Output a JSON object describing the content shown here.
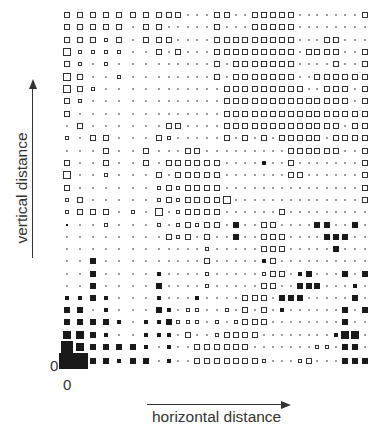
{
  "chart_data": {
    "type": "heatmap",
    "title": "",
    "xlabel": "horizontal distance",
    "ylabel": "vertical distance",
    "x_origin_label": "0",
    "y_origin_label": "0",
    "encoding": "Each cell is a square whose side length encodes magnitude; positive values drawn as open (outline) squares, negative values drawn as filled black squares; near-zero values shown as tiny dots.",
    "grid": {
      "columns": 30,
      "rows": 29
    },
    "column_x": [
      67,
      80,
      93,
      106,
      119,
      133,
      146,
      159,
      169,
      178,
      188,
      197,
      207,
      217,
      227,
      236,
      245,
      255,
      264,
      273,
      282,
      291,
      300,
      309,
      317,
      327,
      336,
      345,
      355,
      365
    ],
    "row_y_top_to_bottom": [
      15,
      27,
      40,
      52,
      64,
      77,
      89,
      101,
      114,
      126,
      138,
      151,
      163,
      175,
      188,
      200,
      212,
      225,
      237,
      249,
      261,
      274,
      286,
      298,
      310,
      322,
      335,
      347,
      361
    ],
    "values_top_to_bottom": [
      [
        5,
        5,
        5,
        5,
        5,
        5,
        5,
        5,
        5,
        5,
        0,
        0,
        0,
        5,
        5,
        0,
        0,
        5,
        4,
        4,
        4,
        4,
        0,
        0,
        0,
        0,
        0,
        0,
        0,
        4
      ],
      [
        5,
        5,
        5,
        5,
        5,
        0,
        4,
        4,
        0,
        0,
        0,
        0,
        0,
        4,
        0,
        0,
        0,
        5,
        4,
        4,
        4,
        4,
        0,
        0,
        0,
        0,
        0,
        0,
        0,
        0
      ],
      [
        5,
        5,
        5,
        3,
        5,
        0,
        4,
        5,
        5,
        0,
        0,
        0,
        0,
        4,
        4,
        4,
        4,
        4,
        4,
        4,
        4,
        4,
        0,
        0,
        0,
        4,
        4,
        0,
        0,
        0
      ],
      [
        6,
        3,
        3,
        3,
        3,
        0,
        0,
        5,
        0,
        4,
        0,
        0,
        0,
        4,
        4,
        4,
        4,
        4,
        4,
        4,
        4,
        4,
        0,
        4,
        4,
        4,
        4,
        0,
        0,
        4
      ],
      [
        5,
        3,
        0,
        3,
        0,
        0,
        0,
        0,
        0,
        0,
        0,
        0,
        0,
        4,
        0,
        4,
        4,
        4,
        4,
        4,
        4,
        4,
        0,
        0,
        0,
        0,
        4,
        0,
        0,
        4
      ],
      [
        6,
        5,
        0,
        0,
        3,
        0,
        0,
        0,
        0,
        0,
        0,
        0,
        0,
        4,
        0,
        4,
        4,
        4,
        4,
        4,
        4,
        4,
        0,
        0,
        4,
        4,
        4,
        4,
        4,
        4
      ],
      [
        6,
        5,
        3,
        0,
        0,
        0,
        0,
        0,
        0,
        0,
        0,
        0,
        0,
        0,
        5,
        5,
        5,
        5,
        5,
        5,
        5,
        5,
        5,
        0,
        0,
        4,
        4,
        4,
        0,
        4
      ],
      [
        5,
        3,
        0,
        0,
        0,
        0,
        0,
        0,
        0,
        0,
        0,
        0,
        0,
        0,
        5,
        5,
        5,
        5,
        5,
        5,
        5,
        5,
        5,
        5,
        5,
        5,
        5,
        5,
        0,
        4
      ],
      [
        5,
        0,
        0,
        0,
        0,
        0,
        0,
        0,
        0,
        0,
        0,
        0,
        0,
        0,
        5,
        5,
        5,
        5,
        5,
        5,
        5,
        5,
        5,
        5,
        5,
        5,
        5,
        5,
        5,
        5
      ],
      [
        0,
        4,
        0,
        0,
        0,
        0,
        0,
        0,
        5,
        5,
        0,
        0,
        0,
        0,
        5,
        5,
        5,
        5,
        5,
        5,
        5,
        5,
        5,
        5,
        5,
        5,
        5,
        0,
        5,
        5
      ],
      [
        3,
        0,
        5,
        4,
        0,
        0,
        0,
        5,
        3,
        0,
        0,
        0,
        0,
        0,
        5,
        0,
        5,
        0,
        5,
        0,
        5,
        5,
        5,
        5,
        5,
        0,
        5,
        5,
        5,
        5
      ],
      [
        0,
        0,
        0,
        5,
        0,
        0,
        4,
        0,
        0,
        0,
        5,
        5,
        0,
        0,
        0,
        0,
        0,
        0,
        0,
        0,
        0,
        5,
        5,
        5,
        5,
        5,
        5,
        0,
        0,
        5
      ],
      [
        4,
        0,
        0,
        5,
        0,
        0,
        4,
        0,
        5,
        5,
        5,
        5,
        5,
        5,
        0,
        0,
        0,
        0,
        -3,
        0,
        0,
        5,
        0,
        0,
        0,
        0,
        0,
        0,
        0,
        5
      ],
      [
        6,
        0,
        0,
        3,
        0,
        0,
        0,
        5,
        0,
        5,
        5,
        5,
        5,
        5,
        0,
        0,
        0,
        0,
        0,
        0,
        0,
        5,
        5,
        0,
        0,
        0,
        0,
        0,
        0,
        5
      ],
      [
        4,
        0,
        0,
        0,
        0,
        0,
        0,
        3,
        5,
        3,
        5,
        5,
        5,
        5,
        0,
        0,
        0,
        0,
        0,
        0,
        0,
        0,
        0,
        0,
        0,
        0,
        0,
        0,
        0,
        4
      ],
      [
        3,
        4,
        0,
        0,
        0,
        0,
        0,
        3,
        5,
        3,
        5,
        5,
        5,
        4,
        6,
        0,
        0,
        0,
        0,
        0,
        0,
        0,
        0,
        0,
        0,
        0,
        0,
        0,
        0,
        4
      ],
      [
        3,
        5,
        5,
        5,
        0,
        3,
        0,
        6,
        0,
        3,
        5,
        5,
        5,
        5,
        0,
        0,
        0,
        0,
        0,
        0,
        5,
        0,
        0,
        0,
        0,
        0,
        0,
        0,
        0,
        0
      ],
      [
        -2,
        0,
        0,
        3,
        0,
        0,
        0,
        3,
        0,
        3,
        4,
        3,
        4,
        4,
        0,
        -4,
        0,
        0,
        5,
        5,
        0,
        0,
        0,
        0,
        -4,
        -4,
        0,
        0,
        -4,
        0
      ],
      [
        0,
        0,
        0,
        0,
        0,
        0,
        0,
        0,
        5,
        3,
        5,
        0,
        5,
        0,
        0,
        -4,
        0,
        0,
        5,
        5,
        5,
        0,
        0,
        0,
        0,
        -4,
        -5,
        -4,
        0,
        0
      ],
      [
        0,
        0,
        0,
        0,
        0,
        0,
        0,
        0,
        0,
        0,
        0,
        0,
        3,
        0,
        0,
        0,
        0,
        0,
        5,
        5,
        5,
        0,
        0,
        0,
        0,
        0,
        -4,
        0,
        0,
        0
      ],
      [
        0,
        0,
        -4,
        0,
        0,
        0,
        0,
        0,
        0,
        0,
        0,
        0,
        4,
        0,
        0,
        0,
        0,
        0,
        -3,
        5,
        0,
        0,
        0,
        0,
        0,
        0,
        0,
        0,
        0,
        0
      ],
      [
        0,
        0,
        -4,
        0,
        0,
        0,
        0,
        -3,
        0,
        0,
        0,
        0,
        3,
        0,
        0,
        0,
        0,
        0,
        3,
        5,
        5,
        0,
        -3,
        -4,
        0,
        0,
        0,
        -4,
        0,
        -5
      ],
      [
        0,
        0,
        -5,
        0,
        0,
        0,
        0,
        -5,
        0,
        0,
        0,
        0,
        3,
        0,
        0,
        0,
        0,
        0,
        4,
        5,
        0,
        0,
        -4,
        -4,
        -4,
        0,
        0,
        0,
        -3,
        0
      ],
      [
        -3,
        -3,
        -4,
        -3,
        0,
        0,
        0,
        -3,
        0,
        0,
        0,
        -3,
        0,
        0,
        0,
        0,
        5,
        5,
        5,
        0,
        -4,
        -4,
        -4,
        0,
        0,
        0,
        0,
        0,
        -4,
        0
      ],
      [
        -4,
        -4,
        0,
        -3,
        0,
        0,
        0,
        -4,
        -3,
        0,
        3,
        3,
        0,
        0,
        3,
        0,
        5,
        0,
        5,
        0,
        -3,
        0,
        0,
        0,
        0,
        0,
        0,
        -4,
        0,
        -4
      ],
      [
        -5,
        -5,
        -4,
        -4,
        -3,
        0,
        -3,
        -3,
        -4,
        3,
        3,
        3,
        0,
        3,
        0,
        3,
        4,
        5,
        5,
        0,
        0,
        0,
        0,
        0,
        0,
        0,
        0,
        -4,
        0,
        0
      ],
      [
        -6,
        -6,
        -4,
        -3,
        0,
        0,
        -3,
        -3,
        -3,
        0,
        5,
        0,
        0,
        3,
        5,
        5,
        4,
        5,
        0,
        0,
        0,
        0,
        0,
        0,
        0,
        0,
        -3,
        -6,
        -6,
        0
      ],
      [
        -8,
        -6,
        -5,
        -5,
        -4,
        -4,
        -3,
        0,
        -3,
        0,
        0,
        5,
        4,
        4,
        5,
        5,
        5,
        0,
        0,
        0,
        0,
        0,
        0,
        0,
        3,
        3,
        0,
        -5,
        -4,
        0
      ],
      [
        -10,
        -10,
        -5,
        -5,
        -3,
        -4,
        -4,
        0,
        -3,
        0,
        0,
        5,
        5,
        5,
        5,
        5,
        5,
        5,
        3,
        0,
        0,
        0,
        3,
        5,
        0,
        0,
        0,
        -5,
        -4,
        -4
      ]
    ]
  }
}
